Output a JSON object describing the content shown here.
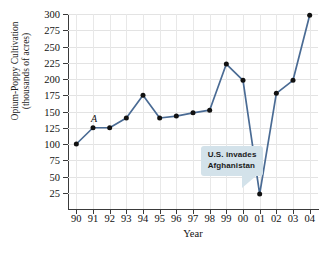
{
  "chart_data": {
    "type": "line",
    "title": "",
    "xlabel": "Year",
    "ylabel": "Opium-Poppy Cultivation (thousands of acres)",
    "ylabel_line1": "Opium-Poppy Cultivation",
    "ylabel_line2": "(thousands of acres)",
    "categories": [
      "90",
      "91",
      "92",
      "93",
      "94",
      "95",
      "96",
      "97",
      "98",
      "99",
      "00",
      "01",
      "02",
      "03",
      "04"
    ],
    "values": [
      100,
      125,
      125,
      140,
      175,
      140,
      143,
      148,
      152,
      223,
      198,
      23,
      178,
      198,
      298
    ],
    "ylim": [
      0,
      300
    ],
    "yticks": [
      25,
      50,
      75,
      100,
      125,
      150,
      175,
      200,
      225,
      250,
      275,
      300
    ],
    "ytick_labels": [
      "25",
      "50",
      "75",
      "100",
      "125",
      "150",
      "175",
      "200",
      "225",
      "250",
      "275",
      "300"
    ],
    "grid": true,
    "legend": "none",
    "series_color": "#4a6b94",
    "marker_color": "#111111",
    "annotations": [
      {
        "name": "point-label-a",
        "text": "A",
        "attached_to_category": "91",
        "attached_to_value": 125,
        "style": "italic-serif"
      },
      {
        "name": "us-invades-callout",
        "text_line1": "U.S. invades",
        "text_line2": "Afghanistan",
        "points_to_category": "01",
        "points_to_value": 23,
        "background_color": "#d3e2ea"
      }
    ]
  }
}
